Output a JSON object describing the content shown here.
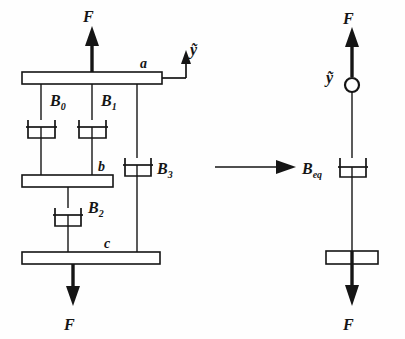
{
  "figure": {
    "background_color": "#fefefe",
    "ink_color": "#151515"
  },
  "left_diagram": {
    "name": "original-damper-network",
    "force_top_label": "F",
    "force_bottom_label": "F",
    "velocity_label": "ỹ",
    "bars": [
      {
        "id": "bar-a",
        "label": "a"
      },
      {
        "id": "bar-b",
        "label": "b"
      },
      {
        "id": "bar-c",
        "label": "c"
      }
    ],
    "dampers": [
      {
        "id": "damper-B0",
        "base": "B",
        "sub": "0",
        "label": "B₀"
      },
      {
        "id": "damper-B1",
        "base": "B",
        "sub": "1",
        "label": "B₁"
      },
      {
        "id": "damper-B2",
        "base": "B",
        "sub": "2",
        "label": "B₂"
      },
      {
        "id": "damper-B3",
        "base": "B",
        "sub": "3",
        "label": "B₃"
      }
    ]
  },
  "transition": {
    "name": "equivalence-arrow",
    "symbol": "→"
  },
  "right_diagram": {
    "name": "equivalent-damper",
    "force_top_label": "F",
    "force_bottom_label": "F",
    "velocity_label": "ỹ",
    "damper": {
      "id": "damper-Beq",
      "base": "B",
      "sub": "eq",
      "label": "Bₑₒ"
    }
  }
}
